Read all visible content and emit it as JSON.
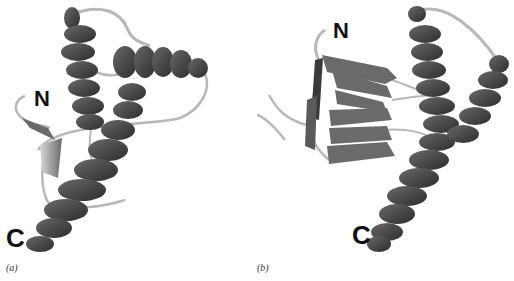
{
  "figure": {
    "panels": [
      {
        "id": "a",
        "caption": "(a)",
        "n_label": "N",
        "c_label": "C",
        "description": "ribbon diagram with three alpha helices and a small beta hairpin"
      },
      {
        "id": "b",
        "caption": "(b)",
        "n_label": "N",
        "c_label": "C",
        "description": "ribbon diagram with a beta-sheet bundle and two long alpha helices"
      }
    ],
    "colors": {
      "helix": "#4a4a4a",
      "helix_highlight": "#7a7a7a",
      "loop": "#b8b8b8",
      "strand": "#6a6a6a",
      "background": "#ffffff",
      "label": "#111111"
    }
  }
}
